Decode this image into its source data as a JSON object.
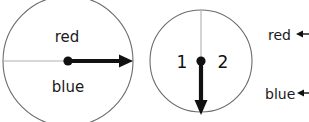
{
  "figure": {
    "background_color": "#ffffff",
    "outline_color": "#6b6b6b",
    "axis_color": "#b0b0b0",
    "ink_color": "#111111"
  },
  "disc_left": {
    "center_x": 68,
    "center_y": 61,
    "radius": 65,
    "axis_orientation": "horizontal",
    "arrow_direction": "right",
    "label_top": "red",
    "label_bottom": "blue"
  },
  "disc_right": {
    "center_x": 201,
    "center_y": 61,
    "radius": 51,
    "axis_orientation": "vertical",
    "arrow_direction": "down",
    "label_left": "1",
    "label_right": "2"
  },
  "legend": {
    "items": [
      {
        "label": "red",
        "y": 35
      },
      {
        "label": "blue",
        "y": 94
      }
    ]
  }
}
